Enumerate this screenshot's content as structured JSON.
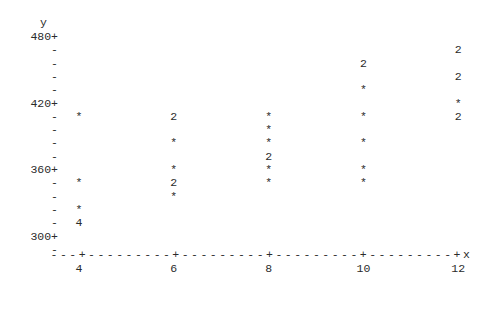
{
  "chart_data": {
    "type": "scatter",
    "title": "",
    "xlabel": "x",
    "ylabel": "y",
    "xlim": [
      3,
      12.6
    ],
    "ylim": [
      288,
      480
    ],
    "grid": false,
    "legend": null,
    "y_axis": {
      "title": "y",
      "major_ticks": [
        480,
        420,
        360,
        300
      ],
      "major_tick_labels": [
        "480+",
        "420+",
        "360+",
        "300+"
      ],
      "minor_tick_glyph": "-",
      "row_step": 12,
      "rows": [
        480,
        468,
        456,
        444,
        432,
        420,
        408,
        396,
        384,
        372,
        360,
        348,
        336,
        324,
        312,
        300,
        288
      ]
    },
    "x_axis": {
      "title": "x",
      "axis_line": "---+---------+---------+---------+---------+x",
      "major_ticks": [
        4,
        6,
        8,
        10,
        12
      ],
      "major_tick_labels": [
        "4",
        "6",
        "8",
        "10",
        "12"
      ],
      "tick_glyph": "+"
    },
    "points": [
      {
        "x": 12,
        "y": 468,
        "glyph": "2",
        "count": 2
      },
      {
        "x": 10,
        "y": 456,
        "glyph": "2",
        "count": 2
      },
      {
        "x": 12,
        "y": 444,
        "glyph": "2",
        "count": 2
      },
      {
        "x": 10,
        "y": 432,
        "glyph": "*",
        "count": 1
      },
      {
        "x": 12,
        "y": 420,
        "glyph": "*",
        "count": 1
      },
      {
        "x": 4,
        "y": 408,
        "glyph": "*",
        "count": 1
      },
      {
        "x": 6,
        "y": 408,
        "glyph": "2",
        "count": 2
      },
      {
        "x": 8,
        "y": 408,
        "glyph": "*",
        "count": 1
      },
      {
        "x": 10,
        "y": 408,
        "glyph": "*",
        "count": 1
      },
      {
        "x": 12,
        "y": 408,
        "glyph": "2",
        "count": 2
      },
      {
        "x": 8,
        "y": 396,
        "glyph": "*",
        "count": 1
      },
      {
        "x": 6,
        "y": 384,
        "glyph": "*",
        "count": 1
      },
      {
        "x": 8,
        "y": 384,
        "glyph": "*",
        "count": 1
      },
      {
        "x": 10,
        "y": 384,
        "glyph": "*",
        "count": 1
      },
      {
        "x": 8,
        "y": 372,
        "glyph": "2",
        "count": 2
      },
      {
        "x": 6,
        "y": 360,
        "glyph": "*",
        "count": 1
      },
      {
        "x": 8,
        "y": 360,
        "glyph": "*",
        "count": 1
      },
      {
        "x": 10,
        "y": 360,
        "glyph": "*",
        "count": 1
      },
      {
        "x": 4,
        "y": 348,
        "glyph": "*",
        "count": 1
      },
      {
        "x": 6,
        "y": 348,
        "glyph": "2",
        "count": 2
      },
      {
        "x": 8,
        "y": 348,
        "glyph": "*",
        "count": 1
      },
      {
        "x": 10,
        "y": 348,
        "glyph": "*",
        "count": 1
      },
      {
        "x": 6,
        "y": 336,
        "glyph": "*",
        "count": 1
      },
      {
        "x": 4,
        "y": 324,
        "glyph": "*",
        "count": 1
      },
      {
        "x": 4,
        "y": 312,
        "glyph": "4",
        "count": 4
      }
    ]
  },
  "style": {
    "text_color": "#2b2b2b",
    "background": "#ffffff"
  }
}
